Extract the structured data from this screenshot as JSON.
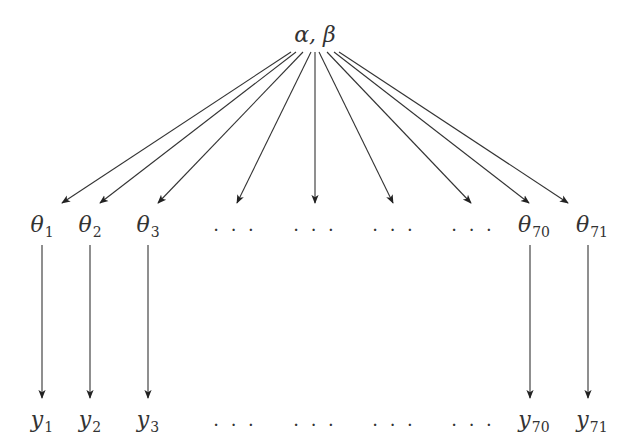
{
  "diagram": {
    "type": "hierarchical-model-graph",
    "root": {
      "label": "α, β"
    },
    "theta_nodes": [
      {
        "sym": "θ",
        "sub": "1",
        "x": 42
      },
      {
        "sym": "θ",
        "sub": "2",
        "x": 90
      },
      {
        "sym": "θ",
        "sub": "3",
        "x": 148
      },
      {
        "sym": "…",
        "sub": "",
        "x": 235
      },
      {
        "sym": "…",
        "sub": "",
        "x": 315
      },
      {
        "sym": "…",
        "sub": "",
        "x": 394
      },
      {
        "sym": "…",
        "sub": "",
        "x": 473
      },
      {
        "sym": "θ",
        "sub": "70",
        "x": 534
      },
      {
        "sym": "θ",
        "sub": "71",
        "x": 592
      }
    ],
    "y_nodes": [
      {
        "sym": "y",
        "sub": "1",
        "x": 42
      },
      {
        "sym": "y",
        "sub": "2",
        "x": 90
      },
      {
        "sym": "y",
        "sub": "3",
        "x": 148
      },
      {
        "sym": "…",
        "sub": "",
        "x": 235
      },
      {
        "sym": "…",
        "sub": "",
        "x": 315
      },
      {
        "sym": "…",
        "sub": "",
        "x": 394
      },
      {
        "sym": "…",
        "sub": "",
        "x": 473
      },
      {
        "sym": "y",
        "sub": "70",
        "x": 534
      },
      {
        "sym": "y",
        "sub": "71",
        "x": 592
      }
    ],
    "edges_root_to_theta": [
      {
        "from": [
          291,
          52
        ],
        "to": [
          62,
          203
        ]
      },
      {
        "from": [
          296,
          52
        ],
        "to": [
          100,
          203
        ]
      },
      {
        "from": [
          303,
          52
        ],
        "to": [
          158,
          203
        ]
      },
      {
        "from": [
          311,
          52
        ],
        "to": [
          237,
          203
        ]
      },
      {
        "from": [
          315,
          52
        ],
        "to": [
          315,
          203
        ]
      },
      {
        "from": [
          319,
          52
        ],
        "to": [
          393,
          203
        ]
      },
      {
        "from": [
          327,
          52
        ],
        "to": [
          471,
          203
        ]
      },
      {
        "from": [
          334,
          52
        ],
        "to": [
          529,
          203
        ]
      },
      {
        "from": [
          339,
          52
        ],
        "to": [
          568,
          203
        ]
      }
    ],
    "edges_theta_to_y": [
      {
        "from": [
          42,
          245
        ],
        "to": [
          42,
          398
        ]
      },
      {
        "from": [
          90,
          245
        ],
        "to": [
          90,
          398
        ]
      },
      {
        "from": [
          148,
          245
        ],
        "to": [
          148,
          398
        ]
      },
      {
        "from": [
          530,
          245
        ],
        "to": [
          530,
          398
        ]
      },
      {
        "from": [
          588,
          245
        ],
        "to": [
          588,
          398
        ]
      }
    ],
    "colors": {
      "stroke": "#333333",
      "text": "#333333",
      "background": "#ffffff"
    }
  }
}
